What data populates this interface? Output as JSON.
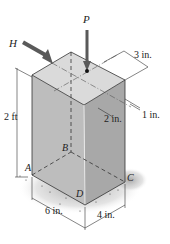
{
  "figure": {
    "forces": {
      "P": "P",
      "H": "H"
    },
    "points": {
      "A": "A",
      "B": "B",
      "C": "C",
      "D": "D"
    },
    "dimensions": {
      "height": "2 ft",
      "width_AD": "6 in.",
      "depth_DC": "4 in.",
      "offset_3": "3 in.",
      "offset_2": "2 in.",
      "offset_1": "1 in."
    },
    "colors": {
      "top_face": "#d9d9d9",
      "left_face": "#bdbdbd",
      "right_face": "#a6a6a6",
      "arrow": "#5a5a5a",
      "edge": "#333333"
    }
  }
}
